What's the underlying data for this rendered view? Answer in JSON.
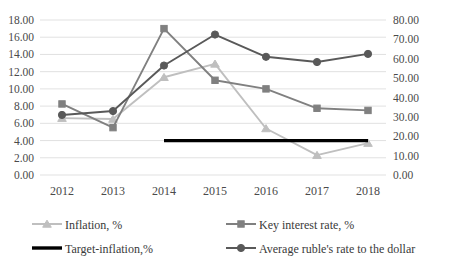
{
  "chart_data": {
    "type": "line",
    "title": "",
    "subtitle": "",
    "xlabel": "",
    "ylabel": "",
    "categories": [
      "2012",
      "2013",
      "2014",
      "2015",
      "2016",
      "2017",
      "2018"
    ],
    "grid": true,
    "legend_position": "bottom",
    "axes": {
      "left": {
        "min": 0.0,
        "max": 18.0,
        "step": 2.0,
        "ticks": [
          "0.00",
          "2.00",
          "4.00",
          "6.00",
          "8.00",
          "10.00",
          "12.00",
          "14.00",
          "16.00",
          "18.00"
        ],
        "tick_values": [
          0.0,
          2.0,
          4.0,
          6.0,
          8.0,
          10.0,
          12.0,
          14.0,
          16.0,
          18.0
        ]
      },
      "right": {
        "min": 0.0,
        "max": 80.0,
        "step": 10.0,
        "ticks": [
          "0.00",
          "10.00",
          "20.00",
          "30.00",
          "40.00",
          "50.00",
          "60.00",
          "70.00",
          "80.00"
        ],
        "tick_values": [
          0.0,
          10.0,
          20.0,
          30.0,
          40.0,
          50.0,
          60.0,
          70.0,
          80.0
        ]
      }
    },
    "series": [
      {
        "name": "Inflation, %",
        "axis": "left",
        "color": "#bfbfbf",
        "marker": "triangle",
        "values": [
          6.6,
          6.5,
          11.35,
          12.9,
          5.4,
          2.3,
          3.7
        ]
      },
      {
        "name": "Key interest rate, %",
        "axis": "left",
        "color": "#808080",
        "marker": "square",
        "values": [
          8.25,
          5.5,
          17.0,
          11.0,
          10.0,
          7.75,
          7.5
        ]
      },
      {
        "name": "Target-inflation,%",
        "axis": "left",
        "color": "#000000",
        "marker": "none",
        "values": [
          null,
          null,
          4.0,
          4.0,
          4.0,
          4.0,
          4.0
        ]
      },
      {
        "name": "Average ruble's rate to the dollar",
        "axis": "right",
        "color": "#595959",
        "marker": "circle",
        "values": [
          31.0,
          33.0,
          56.5,
          72.5,
          61.0,
          58.3,
          62.5
        ]
      }
    ]
  },
  "legend": {
    "items": [
      {
        "label": "Inflation, %",
        "color": "#bfbfbf",
        "marker": "triangle"
      },
      {
        "label": "Key interest rate, %",
        "color": "#808080",
        "marker": "square"
      },
      {
        "label": "Target-inflation,%",
        "color": "#000000",
        "marker": "none"
      },
      {
        "label": "Average ruble's rate to the dollar",
        "color": "#595959",
        "marker": "circle"
      }
    ]
  }
}
